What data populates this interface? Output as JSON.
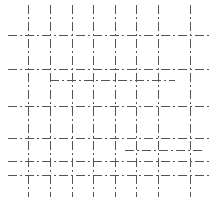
{
  "diagram": {
    "width": 218,
    "height": 210,
    "background": "#ffffff",
    "stroke_color": "#555555",
    "stroke_width": 1,
    "dash_pattern": "9 3 2 3",
    "vertical_lines": [
      {
        "x": 28,
        "y1": 5,
        "y2": 197
      },
      {
        "x": 50,
        "y1": 5,
        "y2": 197
      },
      {
        "x": 72,
        "y1": 5,
        "y2": 197
      },
      {
        "x": 93,
        "y1": 5,
        "y2": 197
      },
      {
        "x": 115,
        "y1": 5,
        "y2": 197
      },
      {
        "x": 136,
        "y1": 5,
        "y2": 197
      },
      {
        "x": 158,
        "y1": 5,
        "y2": 197
      },
      {
        "x": 190,
        "y1": 5,
        "y2": 197
      }
    ],
    "horizontal_lines": [
      {
        "y": 35,
        "x1": 8,
        "x2": 212
      },
      {
        "y": 69,
        "x1": 8,
        "x2": 212
      },
      {
        "y": 106,
        "x1": 8,
        "x2": 212
      },
      {
        "y": 138,
        "x1": 8,
        "x2": 212
      },
      {
        "y": 161,
        "x1": 8,
        "x2": 212
      },
      {
        "y": 175,
        "x1": 8,
        "x2": 212
      }
    ],
    "extra_segments": [
      {
        "x1": 50,
        "y1": 80,
        "x2": 175,
        "y2": 80
      },
      {
        "x1": 125,
        "y1": 150,
        "x2": 203,
        "y2": 150
      }
    ]
  }
}
